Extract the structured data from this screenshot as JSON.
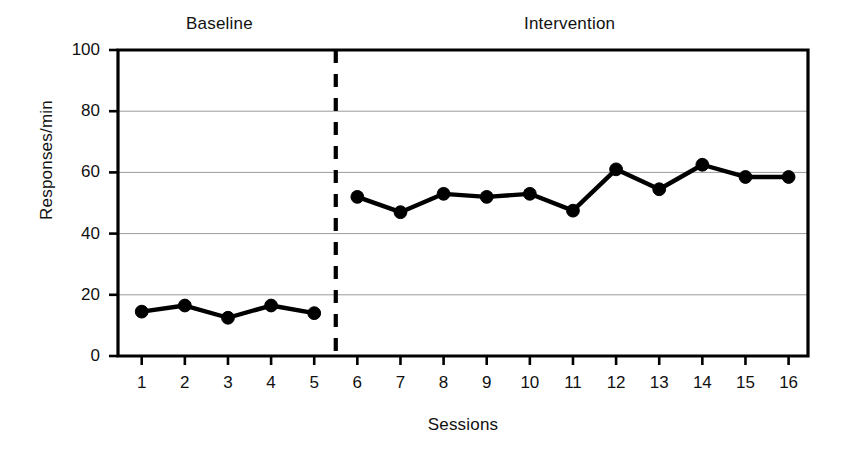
{
  "chart_data": {
    "type": "line",
    "title": "",
    "subtitle": "",
    "xlabel": "Sessions",
    "ylabel": "Responses/min",
    "x": [
      1,
      2,
      3,
      4,
      5,
      6,
      7,
      8,
      9,
      10,
      11,
      12,
      13,
      14,
      15,
      16
    ],
    "xtick_labels": [
      "1",
      "2",
      "3",
      "4",
      "5",
      "6",
      "7",
      "8",
      "9",
      "10",
      "11",
      "12",
      "13",
      "14",
      "15",
      "16"
    ],
    "ytick_labels": [
      "0",
      "20",
      "40",
      "60",
      "80",
      "100"
    ],
    "yticks": [
      0,
      20,
      40,
      60,
      80,
      100
    ],
    "ylim": [
      0,
      100
    ],
    "xlim": [
      0.45,
      16.45
    ],
    "grid": "horizontal-only",
    "legend": "none",
    "series": [
      {
        "name": "Responses per minute",
        "marker": "filled-circle",
        "color": "#000000",
        "values": [
          14.5,
          16.5,
          12.5,
          16.5,
          14.0,
          52.0,
          47.0,
          53.0,
          52.0,
          53.0,
          47.5,
          61.0,
          54.5,
          62.5,
          58.5,
          58.5
        ]
      }
    ],
    "phases": [
      {
        "label": "Baseline",
        "sessions": [
          1,
          2,
          3,
          4,
          5
        ],
        "values": [
          14.5,
          16.5,
          12.5,
          16.5,
          14.0
        ]
      },
      {
        "label": "Intervention",
        "sessions": [
          6,
          7,
          8,
          9,
          10,
          11,
          12,
          13,
          14,
          15,
          16
        ],
        "values": [
          52.0,
          47.0,
          53.0,
          52.0,
          53.0,
          47.5,
          61.0,
          54.5,
          62.5,
          58.5,
          58.5
        ]
      }
    ],
    "annotations": [
      {
        "type": "phase-change-line",
        "style": "dashed-vertical",
        "x": 5.5,
        "color": "#000000"
      }
    ],
    "colors": {
      "line": "#000000",
      "marker": "#000000",
      "axis": "#000000",
      "grid": "#9a9a9a",
      "background": "#ffffff"
    }
  }
}
